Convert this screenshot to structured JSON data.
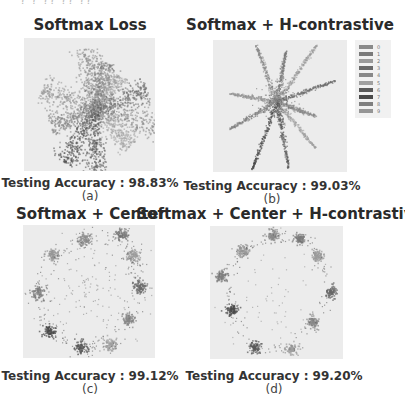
{
  "figure": {
    "top_cut_text": "? ? ?? ?? ??",
    "panels": [
      {
        "id": "a",
        "title": "Softmax Loss",
        "accuracy_label": "Testing Accuracy : 98.83%",
        "sublabel": "(a)"
      },
      {
        "id": "b",
        "title": "Softmax + H-contrastive",
        "accuracy_label": "Testing Accuracy : 99.03%",
        "sublabel": "(b)"
      },
      {
        "id": "c",
        "title": "Softmax + Center",
        "accuracy_label": "Testing Accuracy : 99.12%",
        "sublabel": "(c)"
      },
      {
        "id": "d",
        "title": "Softmax + Center + H-contrastive",
        "accuracy_label": "Testing Accuracy : 99.20%",
        "sublabel": "(d)"
      }
    ],
    "legend": {
      "labels": [
        "0",
        "1",
        "2",
        "3",
        "4",
        "5",
        "6",
        "7",
        "8",
        "9"
      ],
      "colors": [
        "#8a8a8a",
        "#7a7a7a",
        "#9a9a9a",
        "#6a6a6a",
        "#888888",
        "#a0a0a0",
        "#5a5a5a",
        "#4a4a4a",
        "#7f7f7f",
        "#959595"
      ]
    }
  },
  "chart_data": [
    {
      "type": "scatter",
      "title": "Softmax Loss",
      "caption": "Testing Accuracy : 98.83%",
      "description": "10 radial elongated clusters (one per digit class 0-9) emanating from origin, star shape",
      "n_classes": 10,
      "cluster_angles_deg": [
        80,
        100,
        125,
        160,
        200,
        240,
        270,
        300,
        330,
        20
      ],
      "grid": false,
      "color_mode": "grayscale"
    },
    {
      "type": "scatter",
      "title": "Softmax + H-contrastive",
      "caption": "Testing Accuracy : 99.03%",
      "description": "10 thin radial rays from origin, narrower than (a)",
      "n_classes": 10,
      "xlim": [
        -100,
        100
      ],
      "ylim": [
        -100,
        100
      ],
      "x_ticks": [
        "-100",
        "-50",
        "0",
        "50",
        "100"
      ],
      "y_ticks": [
        "100",
        "50",
        "0",
        "-50",
        "-100"
      ],
      "legend_entries": [
        "0",
        "1",
        "2",
        "3",
        "4",
        "5",
        "6",
        "7",
        "8",
        "9"
      ],
      "legend_position": "right",
      "color_mode": "grayscale"
    },
    {
      "type": "scatter",
      "title": "Softmax + Center",
      "caption": "Testing Accuracy : 99.12%",
      "description": "10 compact clusters arranged on a ring with scattered points between",
      "n_classes": 10,
      "color_mode": "grayscale"
    },
    {
      "type": "scatter",
      "title": "Softmax + Center + H-contrastive",
      "caption": "Testing Accuracy : 99.20%",
      "description": "10 compact clusters on a ring, tighter with fewer interior points",
      "n_classes": 10,
      "color_mode": "grayscale"
    }
  ]
}
